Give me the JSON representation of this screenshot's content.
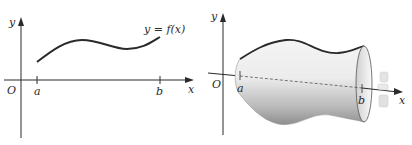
{
  "left_panel": {
    "axis_x_label": "x",
    "axis_y_label": "y",
    "origin_label": "O",
    "tick_a_label": "a",
    "tick_b_label": "b",
    "curve_label": "y = f(x)"
  },
  "right_panel": {
    "axis_x_label": "x",
    "axis_y_label": "y",
    "origin_label": "O",
    "tick_a_label": "a",
    "tick_b_label": "b",
    "rotation_arrow": "rotation-about-x-axis"
  },
  "colors": {
    "ink": "#2a2a2a",
    "surface_light": "#f2f2f2",
    "surface_dark": "#9a9a9a",
    "background": "#ffffff"
  }
}
